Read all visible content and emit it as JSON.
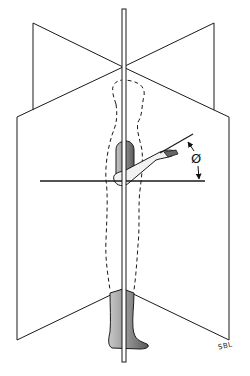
{
  "figure": {
    "angle_label": "Ø",
    "signature": "SBL",
    "colors": {
      "line": "#1a1a1a",
      "figure_shading": "#8a8a8a",
      "background": "#ffffff"
    }
  }
}
